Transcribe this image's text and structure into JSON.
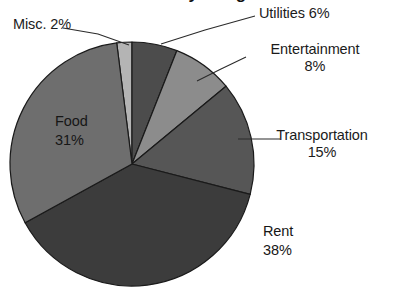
{
  "chart_data": {
    "type": "pie",
    "title": "Monthly Budget",
    "title_visible_fragment": true,
    "categories": [
      "Misc.",
      "Utilities",
      "Entertainment",
      "Transportation",
      "Rent",
      "Food"
    ],
    "values": [
      2,
      6,
      8,
      15,
      38,
      31
    ],
    "value_unit": "%",
    "start_angle_deg": -7.2,
    "direction": "clockwise",
    "legend": "none",
    "grid": false,
    "xlabel": "",
    "ylabel": "",
    "slices": [
      {
        "name": "Misc.",
        "label": "Misc. 2%",
        "label_name": "Misc.",
        "label_value": "2%",
        "percent": 2,
        "color": "#b4b4b4",
        "start_deg": -7.2,
        "end_deg": 0,
        "label_position": "outside-left",
        "leader": true
      },
      {
        "name": "Utilities",
        "label": "Utilities 6%",
        "label_name": "Utilities",
        "label_value": "6%",
        "percent": 6,
        "color": "#4c4c4c",
        "start_deg": 0,
        "end_deg": 21.6,
        "label_position": "outside-right",
        "leader": true
      },
      {
        "name": "Entertainment",
        "label_name": "Entertainment",
        "label_value": "8%",
        "percent": 8,
        "color": "#8c8c8c",
        "start_deg": 21.6,
        "end_deg": 50.4,
        "label_position": "outside-right",
        "leader": true
      },
      {
        "name": "Transportation",
        "label_name": "Transportation",
        "label_value": "15%",
        "percent": 15,
        "color": "#565656",
        "start_deg": 50.4,
        "end_deg": 104.4,
        "label_position": "outside-right",
        "leader": true
      },
      {
        "name": "Rent",
        "label_name": "Rent",
        "label_value": "38%",
        "percent": 38,
        "color": "#3c3c3c",
        "start_deg": 104.4,
        "end_deg": 241.2,
        "label_position": "outside-bottom-right",
        "leader": false
      },
      {
        "name": "Food",
        "label_name": "Food",
        "label_value": "31%",
        "percent": 31,
        "color": "#6e6e6e",
        "start_deg": 241.2,
        "end_deg": 352.8,
        "label_position": "inside",
        "leader": false
      }
    ],
    "geometry": {
      "center_x": 132,
      "center_y": 164,
      "radius": 122
    },
    "colors": {
      "background": "#ffffff",
      "outline": "#1a1a1a",
      "text": "#1b1b1b",
      "leader_line": "#2b2b2b"
    }
  }
}
